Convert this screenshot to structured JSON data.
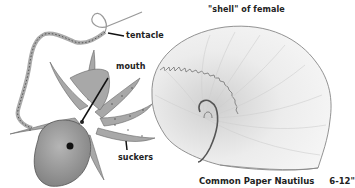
{
  "illustration": {
    "subject": "Common Paper Nautilus (Argonaut) with female shell",
    "labels": {
      "tentacle": "tentacle",
      "mouth": "mouth",
      "suckers": "suckers",
      "shell": "\"shell\" of female"
    },
    "caption": {
      "name": "Common Paper Nautilus",
      "size": "6-12\""
    },
    "colors": {
      "background": "#ffffff",
      "octopus_body": "#9a9a9a",
      "shell": "#e8e8e8",
      "text": "#222222"
    }
  }
}
